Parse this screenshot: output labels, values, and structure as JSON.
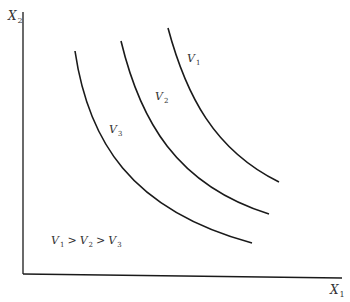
{
  "diagram": {
    "type": "indifference-curves",
    "axes": {
      "y_label": "X",
      "y_label_sub": "2",
      "x_label": "X",
      "x_label_sub": "1"
    },
    "curves": [
      {
        "name": "V",
        "sub": "1"
      },
      {
        "name": "V",
        "sub": "2"
      },
      {
        "name": "V",
        "sub": "3"
      }
    ],
    "relation": {
      "v1": "V",
      "v1_sub": "1",
      "gt1": ">",
      "v2": "V",
      "v2_sub": "2",
      "gt2": ">",
      "v3": "V",
      "v3_sub": "3"
    },
    "colors": {
      "line": "#1a1a1a",
      "text": "#333333",
      "background": "#ffffff"
    }
  }
}
